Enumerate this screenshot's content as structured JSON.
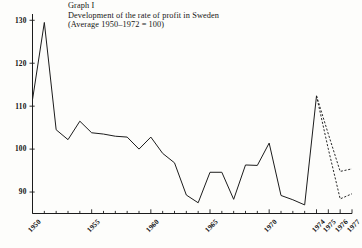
{
  "figure": {
    "label": "Graph I",
    "title": "Development of the rate of profit in Sweden",
    "subtitle": "(Average 1950–1972 = 100)"
  },
  "chart_data": {
    "type": "line",
    "title": "Development of the rate of profit in Sweden",
    "subtitle": "(Average 1950–1972 = 100)",
    "figure_label": "Graph I",
    "xlabel": "",
    "ylabel": "",
    "xlim": [
      1950,
      1977
    ],
    "ylim": [
      85,
      131
    ],
    "grid": false,
    "legend": false,
    "y_ticks": [
      90,
      100,
      110,
      120,
      130
    ],
    "y_tick_labels": [
      "90",
      "100",
      "110",
      "120",
      "130"
    ],
    "x_major_ticks": [
      1950,
      1955,
      1960,
      1965,
      1970,
      1974,
      1975,
      1976,
      1977
    ],
    "x_major_tick_labels": [
      "1950",
      "1955",
      "1960",
      "1965",
      "1970",
      "1974",
      "1975",
      "1976",
      "1977"
    ],
    "x_minor_tick_step": 1,
    "series": [
      {
        "name": "Rate of profit (observed)",
        "style": "solid",
        "x": [
          1950,
          1951,
          1952,
          1953,
          1954,
          1955,
          1956,
          1957,
          1958,
          1959,
          1960,
          1961,
          1962,
          1963,
          1964,
          1965,
          1966,
          1967,
          1968,
          1969,
          1970,
          1971,
          1972,
          1973,
          1974
        ],
        "values": [
          111.5,
          129.5,
          104.5,
          102.2,
          106.5,
          103.8,
          103.5,
          103.0,
          102.8,
          100.0,
          102.8,
          99.0,
          96.8,
          89.3,
          87.5,
          94.6,
          94.6,
          88.3,
          96.3,
          96.2,
          101.4,
          89.2,
          88.2,
          87.0,
          112.4
        ]
      },
      {
        "name": "Projection, upper variant",
        "style": "dashed",
        "x": [
          1974,
          1975,
          1976,
          1977
        ],
        "values": [
          112.4,
          103.5,
          94.8,
          95.4
        ]
      },
      {
        "name": "Projection, lower variant",
        "style": "dashed",
        "x": [
          1974,
          1975,
          1976,
          1977
        ],
        "values": [
          112.4,
          100.0,
          88.4,
          89.6
        ]
      }
    ]
  },
  "colors": {
    "line": "#1c1c1c",
    "axis": "#1c1c1c",
    "background": "#fdfdfb",
    "text": "#151515"
  }
}
